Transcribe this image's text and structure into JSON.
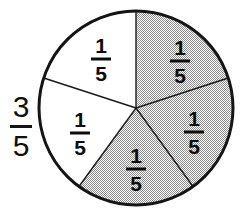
{
  "figure": {
    "background_color": "#ffffff"
  },
  "side_fraction": {
    "name": "three-fifths",
    "numerator": "3",
    "denominator": "5",
    "text": "3/5"
  },
  "pie": {
    "center_x": 136,
    "center_y": 108,
    "radius": 97,
    "outline_color": "#151515",
    "outline_width": 3,
    "divider_color": "#1a1a1a",
    "divider_width": 1.4,
    "shaded_fill_color": "#b8b8b8",
    "unshaded_fill_color": "#ffffff",
    "sector_count": 5,
    "shaded_count": 3,
    "unshaded_count": 2
  },
  "chart_data": {
    "type": "pie",
    "title": "3/5",
    "xlabel": "",
    "ylabel": "",
    "categories": [
      "1/5",
      "1/5",
      "1/5",
      "1/5",
      "1/5"
    ],
    "values": [
      20,
      20,
      20,
      20,
      20
    ],
    "legend": [],
    "annotations": [
      "3/5"
    ],
    "slices": [
      {
        "label": "1/5",
        "numerator": "1",
        "denominator": "5",
        "value": 20,
        "fraction": 0.2,
        "start_angle_deg": 0,
        "end_angle_deg": 72,
        "shaded": true,
        "fill": "#b8b8b8",
        "label_x": 180,
        "label_y": 61
      },
      {
        "label": "1/5",
        "numerator": "1",
        "denominator": "5",
        "value": 20,
        "fraction": 0.2,
        "start_angle_deg": 72,
        "end_angle_deg": 144,
        "shaded": true,
        "fill": "#b8b8b8",
        "label_x": 194,
        "label_y": 132
      },
      {
        "label": "1/5",
        "numerator": "1",
        "denominator": "5",
        "value": 20,
        "fraction": 0.2,
        "start_angle_deg": 144,
        "end_angle_deg": 216,
        "shaded": true,
        "fill": "#b8b8b8",
        "label_x": 136,
        "label_y": 169
      },
      {
        "label": "1/5",
        "numerator": "1",
        "denominator": "5",
        "value": 20,
        "fraction": 0.2,
        "start_angle_deg": 216,
        "end_angle_deg": 288,
        "shaded": false,
        "fill": "#ffffff",
        "label_x": 80,
        "label_y": 133
      },
      {
        "label": "1/5",
        "numerator": "1",
        "denominator": "5",
        "value": 20,
        "fraction": 0.2,
        "start_angle_deg": 288,
        "end_angle_deg": 360,
        "shaded": false,
        "fill": "#ffffff",
        "label_x": 101,
        "label_y": 59
      }
    ]
  }
}
